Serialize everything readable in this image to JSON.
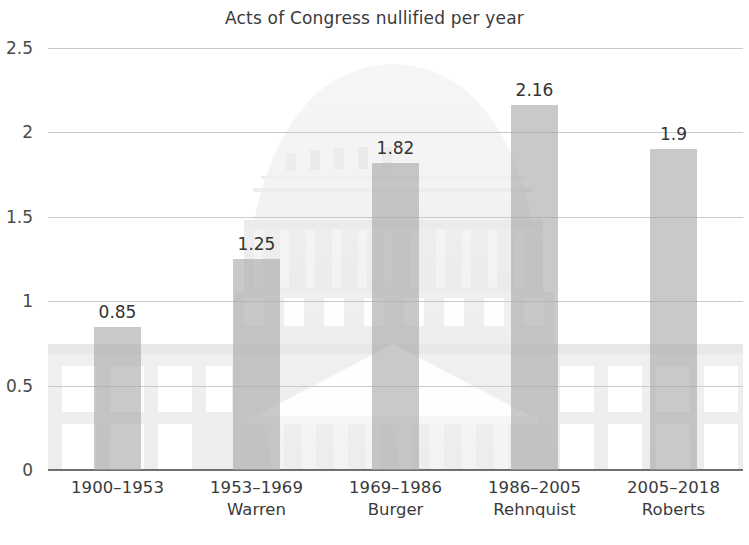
{
  "chart_data": {
    "type": "bar",
    "title": "Acts of Congress nullified per year",
    "xlabel": "",
    "ylabel": "",
    "ylim": [
      0,
      2.5
    ],
    "yticks": [
      "0",
      "0.5",
      "1",
      "1.5",
      "2",
      "2.5"
    ],
    "ytick_values": [
      0,
      0.5,
      1,
      1.5,
      2,
      2.5
    ],
    "grid": true,
    "legend": "none",
    "categories": [
      "1900–1953",
      "1953–1969",
      "1969–1986",
      "1986–2005",
      "2005–2018"
    ],
    "sublabels": [
      "",
      "Warren",
      "Burger",
      "Rehnquist",
      "Roberts"
    ],
    "values": [
      0.85,
      1.25,
      1.82,
      2.16,
      1.9
    ],
    "value_labels": [
      "0.85",
      "1.25",
      "1.82",
      "2.16",
      "1.9"
    ],
    "bar_color": "#a8a8a8",
    "grid_color": "#c9c9c9",
    "axis_color": "#6f6f6f",
    "text_color": "#3a3a3a",
    "background_image": "us-capitol-building-watermark"
  },
  "icons": {
    "capitol": "capitol-building-icon"
  }
}
